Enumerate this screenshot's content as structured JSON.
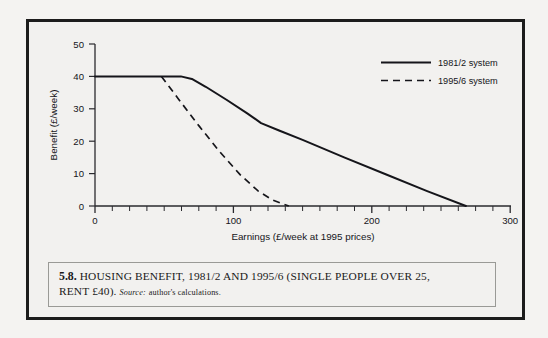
{
  "figure": {
    "caption_number": "5.8.",
    "caption_title": "HOUSING BENEFIT, 1981/2 AND 1995/6 (SINGLE PEOPLE OVER 25,",
    "caption_title_line2": "RENT £40).",
    "caption_source_label": "Source:",
    "caption_source_text": "author's calculations."
  },
  "chart_data": {
    "type": "line",
    "title": "",
    "xlabel": "Earnings (£/week at 1995 prices)",
    "ylabel": "Benefit (£/week)",
    "xlim": [
      0,
      300
    ],
    "ylim": [
      0,
      50
    ],
    "xticks": [
      0,
      100,
      200,
      300
    ],
    "xtick_labels": [
      "0",
      "100",
      "200",
      "300"
    ],
    "xminor_step": 12.5,
    "yticks": [
      0,
      10,
      20,
      30,
      40,
      50
    ],
    "ytick_labels": [
      "0",
      "10",
      "20",
      "30",
      "40",
      "50"
    ],
    "grid": false,
    "legend_position": "top-right",
    "line_color": "#15151a",
    "series": [
      {
        "name": "1981/2 system",
        "style": "solid",
        "points": [
          [
            0,
            40
          ],
          [
            62,
            40
          ],
          [
            70,
            39.2
          ],
          [
            80,
            36.8
          ],
          [
            95,
            32.8
          ],
          [
            110,
            28.6
          ],
          [
            120,
            25.6
          ],
          [
            133,
            23.3
          ],
          [
            150,
            20.4
          ],
          [
            180,
            15.0
          ],
          [
            210,
            9.8
          ],
          [
            240,
            4.6
          ],
          [
            268,
            0
          ]
        ]
      },
      {
        "name": "1995/6 system",
        "style": "dashed",
        "points": [
          [
            48,
            40
          ],
          [
            60,
            33.2
          ],
          [
            75,
            24.8
          ],
          [
            90,
            16.8
          ],
          [
            105,
            9.6
          ],
          [
            118,
            4.6
          ],
          [
            128,
            1.9
          ],
          [
            136,
            0.6
          ],
          [
            140,
            0
          ]
        ]
      }
    ]
  },
  "legend": {
    "items": [
      {
        "label": "1981/2 system",
        "style": "solid"
      },
      {
        "label": "1995/6 system",
        "style": "dashed"
      }
    ]
  }
}
